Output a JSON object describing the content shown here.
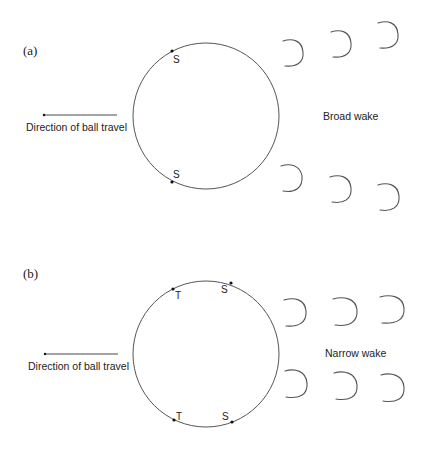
{
  "panels": [
    {
      "label": "(a)",
      "direction_text": "Direction of ball travel",
      "wake_text": "Broad wake",
      "points": [
        {
          "label": "S",
          "position": "upper"
        },
        {
          "label": "S",
          "position": "lower"
        }
      ]
    },
    {
      "label": "(b)",
      "direction_text": "Direction of ball travel",
      "wake_text": "Narrow wake",
      "points": [
        {
          "label": "T",
          "position": "upper-left"
        },
        {
          "label": "S",
          "position": "upper-right"
        },
        {
          "label": "T",
          "position": "lower-left"
        },
        {
          "label": "S",
          "position": "lower-right"
        }
      ]
    }
  ],
  "colors": {
    "line": "#555555",
    "text": "#222222",
    "background": "#ffffff"
  }
}
